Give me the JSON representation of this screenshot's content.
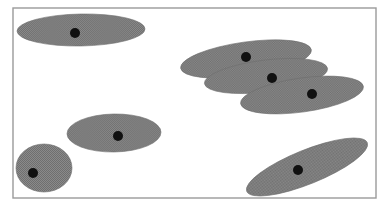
{
  "figure": {
    "title": "",
    "background_color": "#ffffff",
    "width": 388,
    "height": 210
  },
  "frame": {
    "name": "plot-border",
    "x": 13,
    "y": 8,
    "width": 363,
    "height": 190,
    "stroke_color": "#9a9a9a",
    "stroke_width": 1.4,
    "fill_color": "#ffffff"
  },
  "style": {
    "ellipse_fill": "#808080",
    "ellipse_stroke": "#6e6e6e",
    "ellipse_stroke_width": 0.6,
    "dot_fill": "#111111",
    "dot_radius": 5
  },
  "chart_data": {
    "type": "scatter",
    "title": "",
    "xlabel": "",
    "ylabel": "",
    "xlim": [
      13,
      376
    ],
    "ylim": [
      8,
      198
    ],
    "grid": false,
    "legend": "none",
    "annotation": "Seven shaded elliptical clusters, each marked with a single black center point; three ellipses at upper right mutually overlap.",
    "cluster_count": 7,
    "point_count": 7,
    "clusters": [
      {
        "id": 1,
        "label": "top-left-ellipse",
        "center_x": 81,
        "center_y": 30,
        "radius_x": 64,
        "radius_y": 16,
        "rotation_deg": -1,
        "point_x": 75,
        "point_y": 33,
        "overlapping": false
      },
      {
        "id": 2,
        "label": "upper-right-ellipse",
        "center_x": 246,
        "center_y": 59,
        "radius_x": 66,
        "radius_y": 17,
        "rotation_deg": -8,
        "point_x": 246,
        "point_y": 57,
        "overlapping": true
      },
      {
        "id": 3,
        "label": "mid-right-ellipse",
        "center_x": 266,
        "center_y": 76,
        "radius_x": 62,
        "radius_y": 16,
        "rotation_deg": -7,
        "point_x": 272,
        "point_y": 78,
        "overlapping": true
      },
      {
        "id": 4,
        "label": "lower-right-ellipse",
        "center_x": 302,
        "center_y": 95,
        "radius_x": 62,
        "radius_y": 17,
        "rotation_deg": -8,
        "point_x": 312,
        "point_y": 94,
        "overlapping": true
      },
      {
        "id": 5,
        "label": "center-left-ellipse",
        "center_x": 114,
        "center_y": 133,
        "radius_x": 47,
        "radius_y": 19,
        "rotation_deg": -1,
        "point_x": 118,
        "point_y": 136,
        "overlapping": false
      },
      {
        "id": 6,
        "label": "bottom-left-circle",
        "center_x": 44,
        "center_y": 168,
        "radius_x": 28,
        "radius_y": 24,
        "rotation_deg": 0,
        "point_x": 33,
        "point_y": 173,
        "overlapping": false
      },
      {
        "id": 7,
        "label": "bottom-right-ellipse",
        "center_x": 307,
        "center_y": 167,
        "radius_x": 65,
        "radius_y": 17,
        "rotation_deg": -22,
        "point_x": 298,
        "point_y": 170,
        "overlapping": false
      }
    ]
  }
}
